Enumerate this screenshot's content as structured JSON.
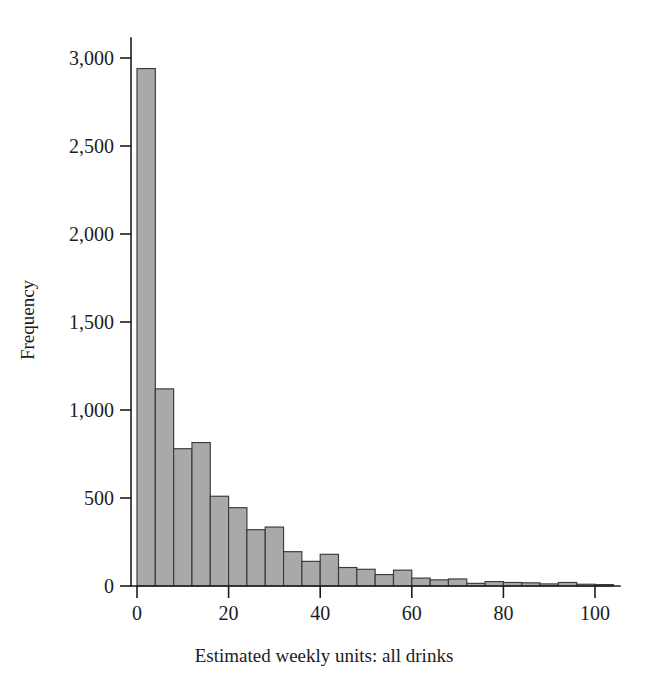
{
  "figure": {
    "background_color": "#ffffff",
    "width": 648,
    "height": 686
  },
  "chart_data": {
    "type": "bar",
    "title": "",
    "subtitle": "",
    "xlabel": "Estimated weekly units: all drinks",
    "ylabel": "Frequency",
    "xlim": [
      -2,
      106
    ],
    "ylim": [
      0,
      3150
    ],
    "grid": false,
    "legend": null,
    "bar_fill_color": "#a9a9a9",
    "bar_edge_color": "#3a3a3a",
    "bin_width": 4,
    "x_ticks": [
      0,
      20,
      40,
      60,
      80,
      100
    ],
    "x_tick_labels": [
      "0",
      "20",
      "40",
      "60",
      "80",
      "100"
    ],
    "y_ticks": [
      0,
      500,
      1000,
      1500,
      2000,
      2500,
      3000
    ],
    "y_tick_labels": [
      "0",
      "500",
      "1,000",
      "1,500",
      "2,000",
      "2,500",
      "3,000"
    ],
    "bin_starts": [
      0,
      4,
      8,
      12,
      16,
      20,
      24,
      28,
      32,
      36,
      40,
      44,
      48,
      52,
      56,
      60,
      64,
      68,
      72,
      76,
      80,
      84,
      88,
      92,
      96,
      100
    ],
    "bin_labels": [
      "0-4",
      "4-8",
      "8-12",
      "12-16",
      "16-20",
      "20-24",
      "24-28",
      "28-32",
      "32-36",
      "36-40",
      "40-44",
      "44-48",
      "48-52",
      "52-56",
      "56-60",
      "60-64",
      "64-68",
      "68-72",
      "72-76",
      "76-80",
      "80-84",
      "84-88",
      "88-92",
      "92-96",
      "96-100",
      "100-104"
    ],
    "categories": [
      "0-4",
      "4-8",
      "8-12",
      "12-16",
      "16-20",
      "20-24",
      "24-28",
      "28-32",
      "32-36",
      "36-40",
      "40-44",
      "44-48",
      "48-52",
      "52-56",
      "56-60",
      "60-64",
      "64-68",
      "68-72",
      "72-76",
      "76-80",
      "80-84",
      "84-88",
      "88-92",
      "92-96",
      "96-100",
      "100-104"
    ],
    "values": [
      2940,
      1120,
      780,
      815,
      510,
      445,
      320,
      335,
      195,
      140,
      180,
      105,
      95,
      65,
      90,
      45,
      35,
      40,
      15,
      25,
      20,
      18,
      12,
      20,
      10,
      8
    ]
  },
  "axis": {
    "y_label_text": "Frequency",
    "x_label_text": "Estimated weekly units: all drinks"
  },
  "geometry": {
    "x0_px": 137,
    "px_per_unit": 4.58,
    "baseline_y_px": 586,
    "y_top_px": 58,
    "y_top_value": 3000,
    "axis_x_px": 131,
    "x_axis_end_px": 620,
    "y_axis_top_px": 38
  }
}
